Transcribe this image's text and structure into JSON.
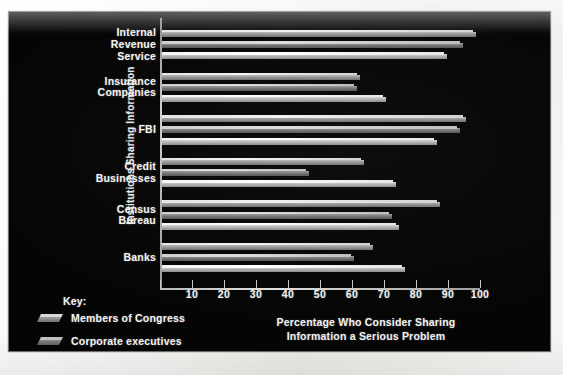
{
  "chart_data": {
    "type": "bar",
    "orientation": "horizontal",
    "title": "",
    "xlabel": "Percentage Who Consider Sharing Information a Serious Problem",
    "xlabel_line1": "Percentage Who Consider Sharing",
    "xlabel_line2": "Information a Serious Problem",
    "ylabel": "Institutions Sharing Information",
    "categories": [
      "Internal Revenue Service",
      "Insurance Companies",
      "FBI",
      "Credit Businesses",
      "Census Bureau",
      "Banks"
    ],
    "category_lines": [
      [
        "Internal",
        "Revenue",
        "Service"
      ],
      [
        "Insurance",
        "Companies"
      ],
      [
        "FBI"
      ],
      [
        "Credit",
        "Businesses"
      ],
      [
        "Census",
        "Bureau"
      ],
      [
        "Banks"
      ]
    ],
    "series": [
      {
        "name": "Members of Congress",
        "values": [
          98,
          62,
          95,
          63,
          87,
          66
        ]
      },
      {
        "name": "Corporate executives",
        "values": [
          94,
          61,
          93,
          46,
          72,
          60
        ]
      },
      {
        "name": "School superintendents",
        "values": [
          89,
          70,
          86,
          73,
          74,
          76
        ]
      }
    ],
    "xlim": [
      0,
      100
    ],
    "xticks": [
      0,
      10,
      20,
      30,
      40,
      50,
      60,
      70,
      80,
      90,
      100
    ],
    "xticklabels": [
      "",
      "10",
      "20",
      "30",
      "40",
      "50",
      "60",
      "70",
      "80",
      "90",
      "100"
    ],
    "grid": false,
    "legend_position": "bottom-left",
    "legend_title": "Key:",
    "background": "#050505",
    "text_color": "#f4f4f4",
    "series_colors": [
      "#8d8d8d",
      "#6e6e6e",
      "#ababab"
    ]
  },
  "legend": {
    "title": "Key:",
    "items": [
      {
        "label": "Members of Congress"
      },
      {
        "label": "Corporate executives"
      },
      {
        "label": "School superintendents"
      }
    ]
  }
}
